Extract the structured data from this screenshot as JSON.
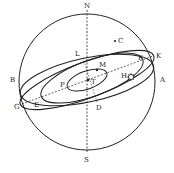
{
  "diagram": {
    "type": "celestial-sphere",
    "colors": {
      "stroke": "#222222",
      "background": "#ffffff"
    },
    "labels": {
      "N": "N",
      "S": "S",
      "A": "A",
      "B": "B",
      "C": "C",
      "D": "D",
      "E": "E",
      "F": "F",
      "G": "G",
      "H": "H",
      "K": "K",
      "L": "L",
      "M": "M",
      "P": "P",
      "T": "T"
    },
    "symbols": {
      "sun": "sun-icon",
      "star": "star-dot"
    }
  }
}
